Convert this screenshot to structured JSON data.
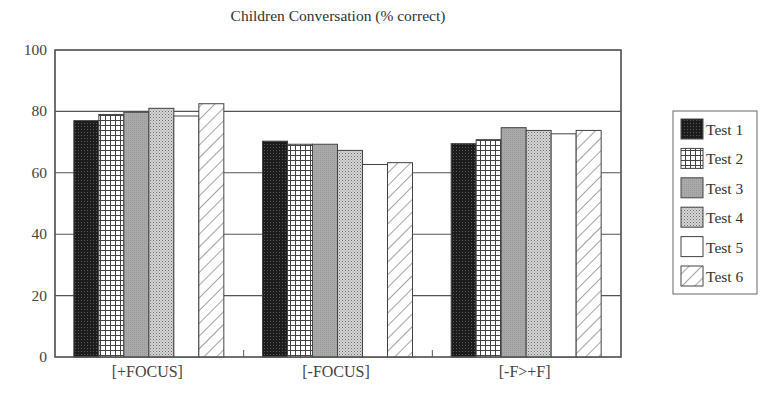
{
  "chart_data": {
    "type": "bar",
    "title": "Children Conversation (% correct)",
    "xlabel": "",
    "ylabel": "",
    "ylim": [
      0,
      100
    ],
    "yticks": [
      0,
      20,
      40,
      60,
      80,
      100
    ],
    "grid": true,
    "legend_position": "right",
    "categories": [
      "[+FOCUS]",
      "[-FOCUS]",
      "[-F>+F]"
    ],
    "series": [
      {
        "name": "Test 1",
        "pattern": "dark-stipple",
        "values": [
          77,
          70.3,
          69.5
        ]
      },
      {
        "name": "Test 2",
        "pattern": "grid",
        "values": [
          79,
          69.3,
          70.8
        ]
      },
      {
        "name": "Test 3",
        "pattern": "gray",
        "values": [
          79.7,
          69.3,
          74.7
        ]
      },
      {
        "name": "Test 4",
        "pattern": "light-stipple",
        "values": [
          81,
          67.3,
          73.8
        ]
      },
      {
        "name": "Test 5",
        "pattern": "white",
        "values": [
          78.5,
          62.7,
          72.7
        ]
      },
      {
        "name": "Test 6",
        "pattern": "diagonal",
        "values": [
          82.5,
          63.3,
          73.8
        ]
      }
    ]
  },
  "colors": {
    "axis": "#555555",
    "dark": "#1a1a1a",
    "gray": "#a8a8a8",
    "hatch": "#555555"
  }
}
